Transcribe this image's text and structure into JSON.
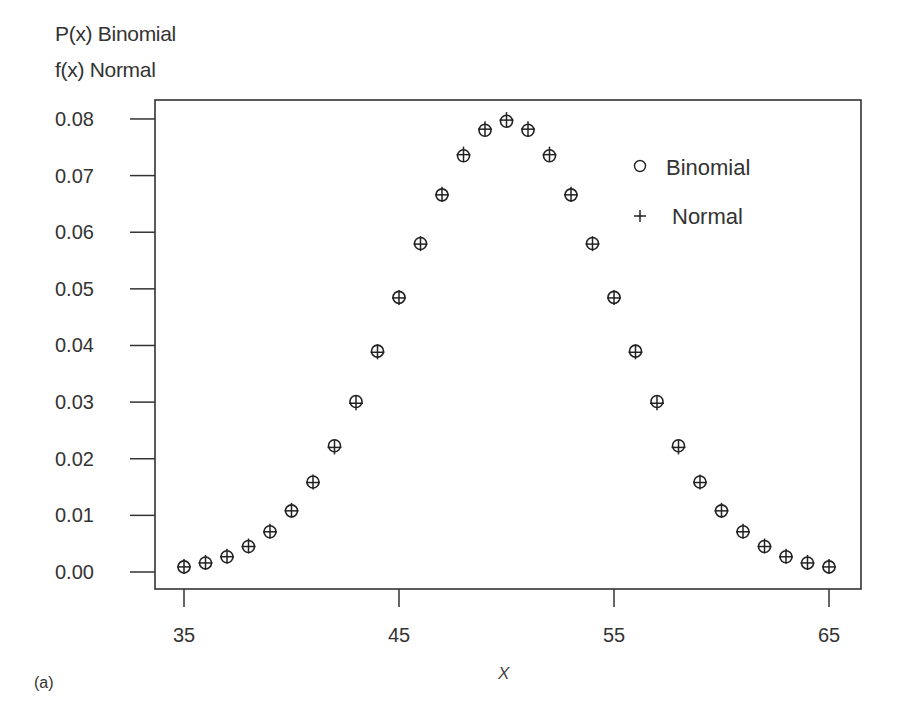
{
  "chart_data": {
    "type": "scatter",
    "title": "",
    "ylabel_lines": [
      "P(x) Binomial",
      "f(x) Normal"
    ],
    "xlabel": "X",
    "panel_label": "(a)",
    "xlim": [
      33.6,
      66.2
    ],
    "ylim": [
      -0.003,
      0.0835
    ],
    "x_ticks": [
      35,
      45,
      55,
      65
    ],
    "y_ticks": [
      "0.00",
      "0.01",
      "0.02",
      "0.03",
      "0.04",
      "0.05",
      "0.06",
      "0.07",
      "0.08"
    ],
    "grid": false,
    "legend_position": "upper right",
    "x": [
      35,
      36,
      37,
      38,
      39,
      40,
      41,
      42,
      43,
      44,
      45,
      46,
      47,
      48,
      49,
      50,
      51,
      52,
      53,
      54,
      55,
      56,
      57,
      58,
      59,
      60,
      61,
      62,
      63,
      64,
      65
    ],
    "series": [
      {
        "name": "Binomial",
        "marker": "circle",
        "values": [
          0.0009,
          0.0016,
          0.0027,
          0.0045,
          0.0071,
          0.0108,
          0.0159,
          0.0223,
          0.0301,
          0.039,
          0.0485,
          0.058,
          0.0666,
          0.0735,
          0.078,
          0.0796,
          0.078,
          0.0735,
          0.0666,
          0.058,
          0.0485,
          0.039,
          0.0301,
          0.0223,
          0.0159,
          0.0108,
          0.0071,
          0.0045,
          0.0027,
          0.0016,
          0.0009
        ]
      },
      {
        "name": "Normal",
        "marker": "plus",
        "values": [
          0.0009,
          0.0016,
          0.0027,
          0.0045,
          0.0071,
          0.0108,
          0.0158,
          0.022,
          0.0298,
          0.0388,
          0.0484,
          0.0579,
          0.0666,
          0.0737,
          0.0782,
          0.0798,
          0.0782,
          0.0737,
          0.0666,
          0.0579,
          0.0484,
          0.0388,
          0.0298,
          0.022,
          0.0158,
          0.0108,
          0.0071,
          0.0045,
          0.0027,
          0.0016,
          0.0009
        ]
      }
    ]
  },
  "legend": {
    "items": [
      {
        "label": "Binomial",
        "symbol": "○"
      },
      {
        "label": "Normal",
        "symbol": "+"
      }
    ]
  },
  "colors": {
    "axis": "#333333",
    "marker": "#222222",
    "text": "#333333"
  }
}
